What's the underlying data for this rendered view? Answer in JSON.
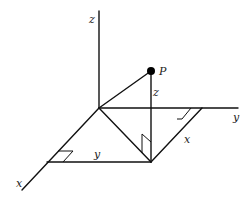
{
  "diagram": {
    "title": "",
    "type": "3D coordinate axes with point P",
    "colors": {
      "stroke": "#111111",
      "label": "#222222",
      "background": "#ffffff",
      "point": "#000000"
    },
    "labels": {
      "z_axis": "z",
      "y_axis": "y",
      "x_axis": "x",
      "point": "P",
      "height": "z",
      "y_distance": "y",
      "x_distance": "x"
    },
    "nodes": [
      {
        "id": "origin",
        "x": 99,
        "y": 108
      },
      {
        "id": "z_top",
        "x": 99,
        "y": 11
      },
      {
        "id": "y_end",
        "x": 238,
        "y": 108
      },
      {
        "id": "x_end",
        "x": 22,
        "y": 190
      },
      {
        "id": "P",
        "x": 151,
        "y": 71
      },
      {
        "id": "Q",
        "x": 151,
        "y": 162
      },
      {
        "id": "y_corner",
        "x": 202,
        "y": 108
      },
      {
        "id": "x_corner",
        "x": 47,
        "y": 162
      }
    ],
    "edges": [
      {
        "from": "origin",
        "to": "z_top",
        "role": "z-axis"
      },
      {
        "from": "origin",
        "to": "y_end",
        "role": "y-axis"
      },
      {
        "from": "origin",
        "to": "x_end",
        "role": "x-axis"
      },
      {
        "from": "origin",
        "to": "P",
        "role": "position vector"
      },
      {
        "from": "P",
        "to": "Q",
        "role": "height z"
      },
      {
        "from": "origin",
        "to": "Q",
        "role": "projection"
      },
      {
        "from": "x_corner",
        "to": "Q",
        "role": "y distance"
      },
      {
        "from": "y_corner",
        "to": "Q",
        "role": "x distance"
      }
    ],
    "right_angle_marks": 3
  }
}
